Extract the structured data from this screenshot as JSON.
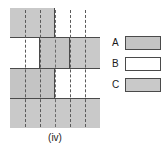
{
  "figure": {
    "caption": "(iv)",
    "colors": {
      "shaded": "#c9c9c9",
      "shaded_alt": "#c4c4c4",
      "unshaded": "#ffffff",
      "line": "#4a4a4a",
      "dash": "#5a5a5a"
    },
    "grid": {
      "columns": 6,
      "rows": 4,
      "dashed_guides": 5,
      "row_list": [
        {
          "index": 1,
          "cells": [
            {
              "label": "row1-left-half",
              "span": "half",
              "fill": "shaded"
            },
            {
              "label": "row1-right-half",
              "span": "half",
              "fill": "unshaded"
            }
          ]
        },
        {
          "index": 2,
          "cells": [
            {
              "label": "row2-left-third",
              "span": "third",
              "fill": "unshaded"
            },
            {
              "label": "row2-middle-third",
              "span": "third",
              "fill": "shaded_alt"
            },
            {
              "label": "row2-right-third",
              "span": "third",
              "fill": "shaded"
            }
          ]
        },
        {
          "index": 3,
          "cells": [
            {
              "label": "row3-left-half",
              "span": "half",
              "fill": "shaded_alt"
            },
            {
              "label": "row3-right-half",
              "span": "half",
              "fill": "unshaded"
            }
          ]
        },
        {
          "index": 4,
          "cells": [
            {
              "label": "row4-full",
              "span": "full",
              "fill": "shaded"
            }
          ]
        }
      ]
    }
  },
  "legend": {
    "items": [
      {
        "label": "A",
        "fill": "shaded_alt"
      },
      {
        "label": "B",
        "fill": "unshaded"
      },
      {
        "label": "C",
        "fill": "shaded"
      }
    ]
  }
}
